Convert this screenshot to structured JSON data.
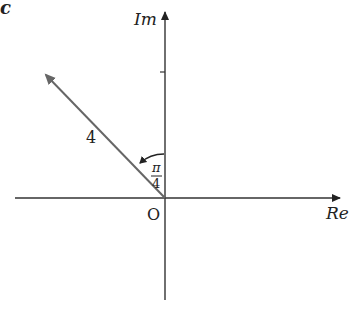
{
  "panel_label": "c",
  "axes": {
    "x_label": "Re",
    "y_label": "Im",
    "origin_label": "O"
  },
  "vector": {
    "magnitude_label": "4",
    "angle_numerator": "π",
    "angle_denominator": "4"
  },
  "colors": {
    "axis": "#222222",
    "vector": "#666666"
  }
}
